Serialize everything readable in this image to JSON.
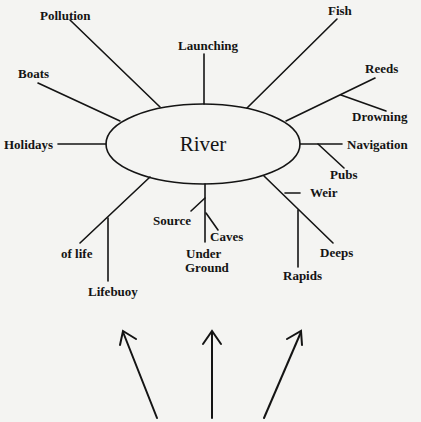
{
  "diagram": {
    "type": "mind-map",
    "center": {
      "label": "River"
    },
    "branches": [
      {
        "id": "pollution",
        "label": "Pollution"
      },
      {
        "id": "launching",
        "label": "Launching"
      },
      {
        "id": "fish",
        "label": "Fish"
      },
      {
        "id": "reeds",
        "label": "Reeds",
        "children": [
          {
            "id": "drowning",
            "label": "Drowning"
          }
        ]
      },
      {
        "id": "boats",
        "label": "Boats"
      },
      {
        "id": "holidays",
        "label": "Holidays"
      },
      {
        "id": "navigation",
        "label": "Navigation",
        "children": [
          {
            "id": "pubs",
            "label": "Pubs"
          }
        ]
      },
      {
        "id": "deeps",
        "label": "Deeps",
        "children": [
          {
            "id": "weir",
            "label": "Weir"
          },
          {
            "id": "rapids",
            "label": "Rapids"
          }
        ]
      },
      {
        "id": "under-ground",
        "label": "Under Ground",
        "children": [
          {
            "id": "source",
            "label": "Source"
          },
          {
            "id": "caves",
            "label": "Caves"
          }
        ]
      },
      {
        "id": "of-life",
        "label": "of life",
        "children": [
          {
            "id": "lifebuoy",
            "label": "Lifebuoy"
          }
        ]
      }
    ],
    "labels": {
      "pollution": "Pollution",
      "launching": "Launching",
      "fish": "Fish",
      "reeds": "Reeds",
      "drowning": "Drowning",
      "boats": "Boats",
      "holidays": "Holidays",
      "navigation": "Navigation",
      "pubs": "Pubs",
      "weir": "Weir",
      "deeps": "Deeps",
      "rapids": "Rapids",
      "source": "Source",
      "caves": "Caves",
      "under": "Under",
      "ground": "Ground",
      "of_life": "of life",
      "lifebuoy": "Lifebuoy"
    },
    "arrows": {
      "count": 3,
      "direction": "up"
    },
    "colors": {
      "ink": "#141414",
      "paper": "#f4f4f2"
    }
  }
}
